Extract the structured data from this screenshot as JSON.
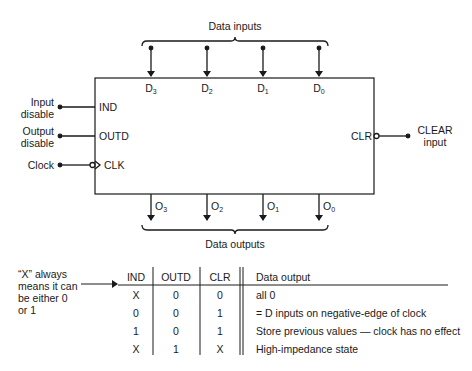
{
  "diagram": {
    "title_inputs": "Data inputs",
    "title_outputs": "Data outputs",
    "data_inputs": [
      {
        "name": "D",
        "sub": "3"
      },
      {
        "name": "D",
        "sub": "2"
      },
      {
        "name": "D",
        "sub": "1"
      },
      {
        "name": "D",
        "sub": "0"
      }
    ],
    "data_outputs": [
      {
        "name": "O",
        "sub": "3"
      },
      {
        "name": "O",
        "sub": "2"
      },
      {
        "name": "O",
        "sub": "1"
      },
      {
        "name": "O",
        "sub": "0"
      }
    ],
    "left_pins": [
      {
        "pin": "IND",
        "external_label_line1": "Input",
        "external_label_line2": "disable"
      },
      {
        "pin": "OUTD",
        "external_label_line1": "Output",
        "external_label_line2": "disable"
      },
      {
        "pin": "CLK",
        "external_label_line1": "Clock",
        "external_label_line2": ""
      }
    ],
    "right_pin": {
      "pin": "CLR",
      "external_label_line1": "CLEAR",
      "external_label_line2": "input"
    }
  },
  "note": {
    "line1": "“X” always",
    "line2": "means it can",
    "line3": "be either 0",
    "line4": "or 1"
  },
  "truth_table": {
    "headers": [
      "IND",
      "OUTD",
      "CLR",
      "Data output"
    ],
    "rows": [
      [
        "X",
        "0",
        "0",
        "all 0"
      ],
      [
        "0",
        "0",
        "1",
        "= D inputs on negative-edge of clock"
      ],
      [
        "1",
        "0",
        "1",
        "Store previous values — clock has no effect"
      ],
      [
        "X",
        "1",
        "X",
        "High-impedance state"
      ]
    ]
  }
}
